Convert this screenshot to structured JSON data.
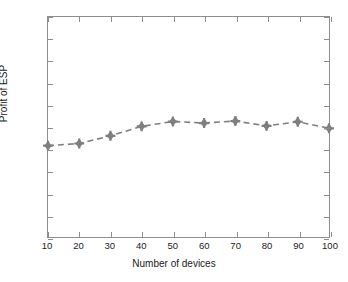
{
  "chart_data": {
    "type": "line",
    "title": "",
    "xlabel": "Number of devices",
    "ylabel": "Profit of ESP",
    "x": [
      10,
      20,
      30,
      40,
      50,
      60,
      70,
      80,
      90,
      100
    ],
    "values": [
      0.415,
      0.425,
      0.46,
      0.503,
      0.525,
      0.518,
      0.527,
      0.505,
      0.524,
      0.494
    ],
    "series": [
      {
        "name": "Profit of ESP",
        "values": [
          0.415,
          0.425,
          0.46,
          0.503,
          0.525,
          0.518,
          0.527,
          0.505,
          0.524,
          0.494
        ]
      }
    ],
    "xlim": [
      10,
      100
    ],
    "ylim": [
      0,
      1
    ],
    "xticks": [
      "10",
      "20",
      "30",
      "40",
      "50",
      "60",
      "70",
      "80",
      "90",
      "100"
    ],
    "yticks": [
      "0",
      "0.1",
      "0.2",
      "0.3",
      "0.4",
      "0.5",
      "0.6",
      "0.7",
      "0.8",
      "0.9",
      "1"
    ],
    "grid": false,
    "legend": "none",
    "line_style": "dashed",
    "marker": "diamond-star",
    "series_color": "#7f7f7f",
    "axis_color": "#8d8d8d",
    "text_color": "#1a1a1a",
    "background_color": "#ffffff"
  }
}
